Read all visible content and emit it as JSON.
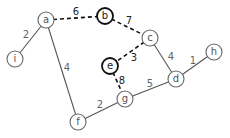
{
  "graph": {
    "nodes": [
      {
        "id": "a",
        "label": "a",
        "x": 46,
        "y": 20,
        "highlighted": false
      },
      {
        "id": "b",
        "label": "b",
        "x": 105,
        "y": 16,
        "highlighted": true
      },
      {
        "id": "c",
        "label": "c",
        "x": 150,
        "y": 38,
        "highlighted": false
      },
      {
        "id": "e",
        "label": "e",
        "x": 110,
        "y": 66,
        "highlighted": true
      },
      {
        "id": "d",
        "label": "d",
        "x": 176,
        "y": 79,
        "highlighted": false
      },
      {
        "id": "h",
        "label": "h",
        "x": 214,
        "y": 52,
        "highlighted": false
      },
      {
        "id": "g",
        "label": "g",
        "x": 125,
        "y": 99,
        "highlighted": false
      },
      {
        "id": "f",
        "label": "f",
        "x": 78,
        "y": 122,
        "highlighted": false
      },
      {
        "id": "i",
        "label": "i",
        "x": 15,
        "y": 59,
        "highlighted": false
      }
    ],
    "edges": [
      {
        "from": "a",
        "to": "b",
        "weight": "6",
        "style": "dashed",
        "lx": 76,
        "ly": 11
      },
      {
        "from": "b",
        "to": "c",
        "weight": "7",
        "style": "dashed",
        "lx": 129,
        "ly": 20
      },
      {
        "from": "c",
        "to": "e",
        "weight": "3",
        "style": "dashed",
        "lx": 134,
        "ly": 57
      },
      {
        "from": "e",
        "to": "g",
        "weight": "8",
        "style": "dashed",
        "lx": 122,
        "ly": 80
      },
      {
        "from": "a",
        "to": "i",
        "weight": "2",
        "style": "solid",
        "lx": 26,
        "ly": 34
      },
      {
        "from": "a",
        "to": "f",
        "weight": "4",
        "style": "solid",
        "lx": 67,
        "ly": 67
      },
      {
        "from": "f",
        "to": "g",
        "weight": "2",
        "style": "solid",
        "lx": 100,
        "ly": 104
      },
      {
        "from": "g",
        "to": "d",
        "weight": "5",
        "style": "solid",
        "lx": 150,
        "ly": 83
      },
      {
        "from": "c",
        "to": "d",
        "weight": "4",
        "style": "solid",
        "lx": 171,
        "ly": 56
      },
      {
        "from": "d",
        "to": "h",
        "weight": "1",
        "style": "solid",
        "lx": 193,
        "ly": 60
      }
    ]
  }
}
